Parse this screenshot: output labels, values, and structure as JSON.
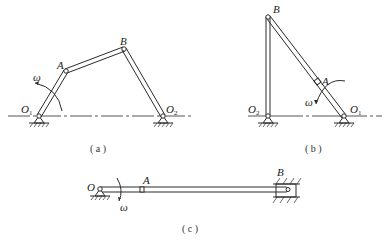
{
  "figures": [
    {
      "id": "a",
      "caption": "( a )",
      "type": "four-bar linkage (crank-rocker)",
      "points": {
        "O1": {
          "label": "O",
          "sub": "1"
        },
        "A": {
          "label": "A"
        },
        "B": {
          "label": "B"
        },
        "O2": {
          "label": "O",
          "sub": "2"
        }
      },
      "omega": "ω"
    },
    {
      "id": "b",
      "caption": "( b )",
      "type": "four-bar linkage",
      "points": {
        "B": {
          "label": "B"
        },
        "A": {
          "label": "A"
        },
        "O2": {
          "label": "O",
          "sub": "2"
        },
        "O1": {
          "label": "O",
          "sub": "1"
        }
      },
      "omega": "ω"
    },
    {
      "id": "c",
      "caption": "( c )",
      "type": "slider-crank mechanism",
      "points": {
        "O": {
          "label": "O"
        },
        "A": {
          "label": "A"
        },
        "B": {
          "label": "B"
        }
      },
      "omega": "ω"
    }
  ]
}
